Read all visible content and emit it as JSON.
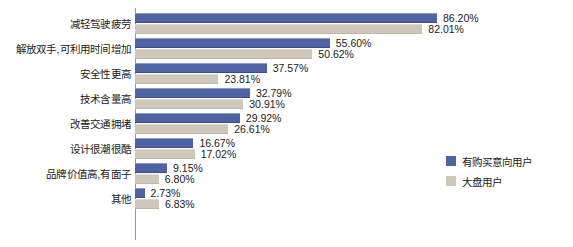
{
  "chart_data": {
    "type": "bar",
    "orientation": "horizontal",
    "title": "",
    "subtitle": "",
    "xlabel": "",
    "ylabel": "",
    "xlim": [
      0,
      86.2
    ],
    "grid": false,
    "legend_position": "right",
    "value_suffix": "%",
    "categories": [
      "减轻驾驶疲劳",
      "解放双手,可利用时间增加",
      "安全性更高",
      "技术含量高",
      "改善交通拥堵",
      "设计很潮很酷",
      "品牌价值高,有面子",
      "其他"
    ],
    "series": [
      {
        "name": "有购买意向用户",
        "color": "#4e62a6",
        "values": [
          86.2,
          55.6,
          37.57,
          32.79,
          29.92,
          16.67,
          9.15,
          2.73
        ],
        "labels": [
          "86.20%",
          "55.60%",
          "37.57%",
          "32.79%",
          "29.92%",
          "16.67%",
          "9.15%",
          "2.73%"
        ]
      },
      {
        "name": "大盘用户",
        "color": "#cfc8ba",
        "values": [
          82.01,
          50.62,
          23.81,
          30.91,
          26.61,
          17.02,
          6.8,
          6.83
        ],
        "labels": [
          "82.01%",
          "50.62%",
          "23.81%",
          "30.91%",
          "26.61%",
          "17.02%",
          "6.80%",
          "6.83%"
        ]
      }
    ]
  },
  "legend": {
    "items": [
      {
        "label": "有购买意向用户",
        "color": "#4e62a6"
      },
      {
        "label": "大盘用户",
        "color": "#cfc8ba"
      }
    ]
  },
  "colors": {
    "series_blue": "#4e62a6",
    "series_beige": "#cfc8ba",
    "axis": "#9a9a9a",
    "text": "#1b1b1b",
    "background": "#ffffff"
  }
}
